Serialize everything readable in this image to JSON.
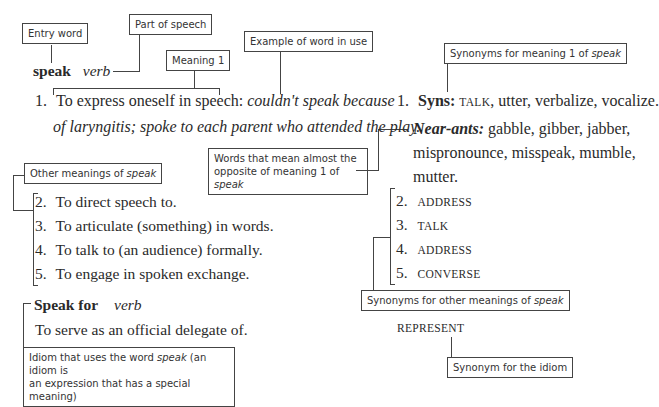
{
  "labels": {
    "entry_word": "Entry word",
    "part_of_speech": "Part of speech",
    "meaning_1": "Meaning 1",
    "example": "Example of word in use",
    "synonyms_meaning_1_prefix": "Synonyms for meaning 1 of ",
    "synonyms_meaning_1_word": "speak",
    "near_ants_line1": "Words that mean almost the",
    "near_ants_line2_prefix": "opposite of meaning 1 of ",
    "near_ants_word": "speak",
    "other_meanings_prefix": "Other meanings of ",
    "other_meanings_word": "speak",
    "synonyms_other_prefix": "Synonyms for other meanings of ",
    "synonyms_other_word": "speak",
    "idiom_line1_prefix": "Idiom that uses the word ",
    "idiom_word": "speak",
    "idiom_line1_suffix": " (an idiom is",
    "idiom_line2": "an expression that has a special meaning)",
    "synonym_idiom": "Synonym for the idiom"
  },
  "entry": {
    "word": "speak",
    "pos": "verb",
    "meaning_1": {
      "number": "1.",
      "definition": "To express oneself in speech: ",
      "example_line1": "couldn't speak because",
      "example_line2": "of laryngitis; spoke to each parent who attended the play."
    },
    "other_meanings": [
      {
        "number": "2.",
        "text": "To direct speech to."
      },
      {
        "number": "3.",
        "text": "To articulate (something) in words."
      },
      {
        "number": "4.",
        "text": "To talk to (an audience) formally."
      },
      {
        "number": "5.",
        "text": "To engage in spoken exchange."
      }
    ],
    "idiom": {
      "phrase": "Speak for",
      "pos": "verb",
      "definition": "To serve as an official delegate of."
    }
  },
  "thesaurus": {
    "meaning_1": {
      "number": "1.",
      "syns_label": "Syns:",
      "syns_first": "TALK",
      "syns_rest": ", utter, verbalize, vocalize.",
      "near_ants_label": "Near-ants:",
      "near_ants_line1": " gabble, gibber, jabber,",
      "near_ants_line2": "mispronounce, misspeak, mumble,",
      "near_ants_line3": "mutter."
    },
    "other_meanings": [
      {
        "number": "2.",
        "syn": "ADDRESS"
      },
      {
        "number": "3.",
        "syn": "TALK"
      },
      {
        "number": "4.",
        "syn": "ADDRESS"
      },
      {
        "number": "5.",
        "syn": "CONVERSE"
      }
    ],
    "idiom_synonym": "REPRESENT"
  }
}
